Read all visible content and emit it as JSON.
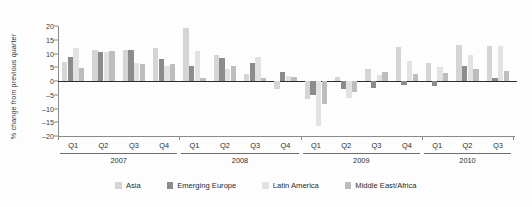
{
  "chart_data": {
    "type": "bar",
    "title": "",
    "subtitle": "",
    "xlabel": "",
    "ylabel": "% change from previous quarter",
    "ylim": [
      -20,
      20
    ],
    "ytick_step": 5,
    "yticks": [
      20,
      15,
      10,
      5,
      0,
      -5,
      -10,
      -15,
      -20
    ],
    "ytick_labels": [
      "20",
      "15",
      "10",
      "5",
      "0",
      "-5",
      "-10",
      "-15",
      "-20"
    ],
    "grid": false,
    "legend_position": "bottom",
    "orientation": "vertical",
    "categories": [
      "Q1",
      "Q2",
      "Q3",
      "Q4",
      "Q1",
      "Q2",
      "Q3",
      "Q4",
      "Q1",
      "Q2",
      "Q3",
      "Q4",
      "Q1",
      "Q2",
      "Q3"
    ],
    "year_groups": [
      {
        "year": "2007",
        "quarters": [
          "Q1",
          "Q2",
          "Q3",
          "Q4"
        ]
      },
      {
        "year": "2008",
        "quarters": [
          "Q1",
          "Q2",
          "Q3",
          "Q4"
        ]
      },
      {
        "year": "2009",
        "quarters": [
          "Q1",
          "Q2",
          "Q3",
          "Q4"
        ]
      },
      {
        "year": "2010",
        "quarters": [
          "Q1",
          "Q2",
          "Q3"
        ]
      }
    ],
    "series": [
      {
        "name": "Asia",
        "color": "#d5d5d5",
        "values": [
          7.0,
          11.2,
          11.2,
          11.9,
          19.3,
          9.5,
          2.6,
          -3.0,
          -6.4,
          1.4,
          4.3,
          12.4,
          6.6,
          13.0,
          12.6
        ]
      },
      {
        "name": "Emerging Europe",
        "color": "#8c8c8c",
        "values": [
          8.6,
          10.6,
          11.2,
          8.0,
          5.5,
          8.2,
          6.7,
          3.3,
          -5.0,
          -2.8,
          -2.4,
          -1.6,
          -1.9,
          5.5,
          1.0
        ]
      },
      {
        "name": "Latin America",
        "color": "#e2e2e2",
        "values": [
          11.9,
          10.6,
          6.5,
          5.4,
          11.0,
          4.5,
          8.7,
          1.7,
          -16.2,
          -6.0,
          2.1,
          7.3,
          5.2,
          9.4,
          12.7
        ]
      },
      {
        "name": "Middle East/Africa",
        "color": "#bdbdbd",
        "values": [
          4.8,
          11.0,
          6.3,
          6.2,
          1.1,
          5.3,
          1.2,
          1.5,
          -8.3,
          -4.0,
          3.2,
          2.4,
          3.0,
          4.4,
          3.5
        ]
      }
    ]
  },
  "legend": {
    "items": [
      {
        "label": "Asia",
        "color": "#d5d5d5"
      },
      {
        "label": "Emerging Europe",
        "color": "#8c8c8c"
      },
      {
        "label": "Latin America",
        "color": "#e2e2e2"
      },
      {
        "label": "Middle East/Africa",
        "color": "#bdbdbd"
      }
    ]
  }
}
